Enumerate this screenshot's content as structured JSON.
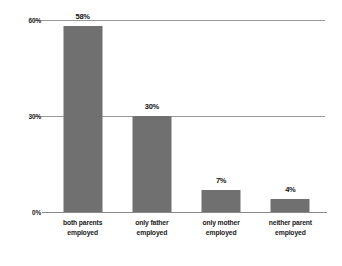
{
  "chart_data": {
    "type": "bar",
    "title": "",
    "subtitle": "",
    "xlabel": "",
    "ylabel": "",
    "categories": [
      "both parents employed",
      "only father employed",
      "only mother employed",
      "neither parent employed"
    ],
    "category_lines": [
      [
        "both parents",
        "employed"
      ],
      [
        "only father",
        "employed"
      ],
      [
        "only mother",
        "employed"
      ],
      [
        "neither parent",
        "employed"
      ]
    ],
    "values": [
      58,
      30,
      7,
      4
    ],
    "value_labels": [
      "58%",
      "30%",
      "7%",
      "4%"
    ],
    "ylim": [
      0,
      60
    ],
    "yticks": [
      0,
      30,
      60
    ],
    "ytick_labels": [
      "0%",
      "30%",
      "60%"
    ],
    "grid": true,
    "legend": "none",
    "colors": {
      "bar": "#707070",
      "gridline": "#9a9a9a",
      "axis": "#8a8a8a",
      "text": "#1a1a1a",
      "background": "#ffffff"
    }
  }
}
